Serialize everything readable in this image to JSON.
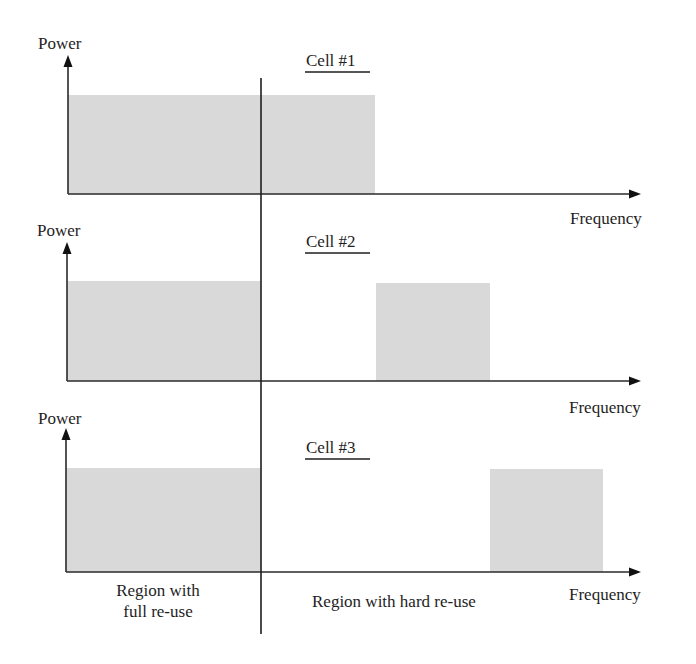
{
  "diagram": {
    "type": "frequency-reuse-spectrum",
    "colors": {
      "band_fill": "#d9d9d9",
      "axis": "#2a2a2a",
      "text": "#1e1e1e",
      "background": "#ffffff"
    },
    "divider_x": 261,
    "panels": [
      {
        "title": "Cell #1",
        "y_label": "Power",
        "x_label": "Frequency",
        "axis": {
          "x0": 68,
          "y_top": 56,
          "baseline": 194,
          "x_end": 640
        },
        "bands": [
          {
            "x1": 68,
            "x2": 375,
            "top": 95
          }
        ]
      },
      {
        "title": "Cell #2",
        "y_label": "Power",
        "x_label": "Frequency",
        "axis": {
          "x0": 67,
          "y_top": 243,
          "baseline": 381,
          "x_end": 640
        },
        "bands": [
          {
            "x1": 67,
            "x2": 261,
            "top": 281
          },
          {
            "x1": 376,
            "x2": 490,
            "top": 283
          }
        ]
      },
      {
        "title": "Cell #3",
        "y_label": "Power",
        "x_label": "Frequency",
        "axis": {
          "x0": 66,
          "y_top": 428,
          "baseline": 572,
          "x_end": 640
        },
        "bands": [
          {
            "x1": 66,
            "x2": 261,
            "top": 468
          },
          {
            "x1": 490,
            "x2": 603,
            "top": 469
          }
        ]
      }
    ],
    "regions": {
      "full_reuse": {
        "line1": "Region with",
        "line2": "full re-use"
      },
      "hard_reuse": {
        "label": "Region with hard re-use"
      }
    }
  }
}
